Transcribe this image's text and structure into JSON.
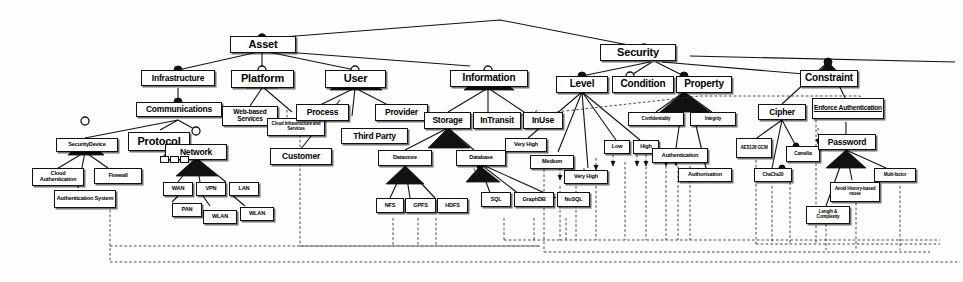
{
  "diagram": {
    "type": "uml-class-hierarchy",
    "colors": {
      "line": "#111111",
      "box_fill": "#ffffff",
      "box_border": "#111111",
      "dashed": "#444444"
    },
    "legend": {
      "filled_diamond": "composition",
      "hollow_diamond": "aggregation",
      "filled_triangle": "generalization",
      "dashed_arrow": "dependency"
    }
  },
  "nodes": {
    "asset": "Asset",
    "security": "Security",
    "infrastructure": "Infrastructure",
    "platform": "Platform",
    "user": "User",
    "information": "Information",
    "communications": "Communications",
    "web_based_services": "Web-based Services",
    "cloud_infra_services": "Cloud Infrastructure and Services",
    "process": "Process",
    "provider": "Provider",
    "third_party": "Third Party",
    "customer": "Customer",
    "security_device": "SecurityDevice",
    "protocol": "Protocol",
    "network": "Network",
    "cloud_authentication": "Cloud Authentication",
    "firewall": "Firewall",
    "authentication_system": "Authentication System",
    "wan": "WAN",
    "vpn": "VPN",
    "lan": "LAN",
    "pan": "PAN",
    "wlan_1": "WLAN",
    "wlan_2": "WLAN",
    "storage": "Storage",
    "intransit": "InTransit",
    "inuse": "InUse",
    "datastore": "Datastore",
    "database": "Database",
    "nfs": "NFS",
    "gpfs": "GPFS",
    "hdfs": "HDFS",
    "sql": "SQL",
    "graphdb": "GraphDB",
    "nosql": "NoSQL",
    "level": "Level",
    "condition": "Condition",
    "property": "Property",
    "very_high_1": "Very High",
    "medium": "Medium",
    "very_high_2": "Very High",
    "low": "Low",
    "high": "High",
    "confidentiality": "Confidentiality",
    "integrity": "Integrity",
    "authentication": "Authentication",
    "authorisation": "Authorisation",
    "constraint": "Constraint",
    "cipher": "Cipher",
    "enforce_authentication": "Enforce Authentication",
    "aes128_gcm": "AES128 GCM",
    "chacha20": "ChaCha20",
    "camellia": "Camellia",
    "password": "Password",
    "multi_factor": "Multi-factor",
    "avoid_history_reuse": "Avoid History-based reuse",
    "length_complexity": "Length & Complexity",
    "proto_a": "",
    "proto_b": "",
    "proto_c": ""
  },
  "hierarchy": {
    "roots": [
      "Asset",
      "Security"
    ],
    "asset_children": [
      "Infrastructure",
      "Platform",
      "User",
      "Information"
    ],
    "security_children": [
      "Level",
      "Condition",
      "Property",
      "Constraint"
    ],
    "infrastructure_children": [
      "Communications"
    ],
    "communications_children": [
      "SecurityDevice",
      "Protocol",
      "Network"
    ],
    "securitydevice_children": [
      "Cloud Authentication",
      "Authentication System",
      "Firewall"
    ],
    "network_children": [
      "WAN",
      "VPN",
      "LAN",
      "PAN",
      "WLAN",
      "WLAN"
    ],
    "platform_children": [
      "Web-based Services",
      "Cloud Infrastructure and Services"
    ],
    "user_children": [
      "Process",
      "Third Party",
      "Provider",
      "Customer"
    ],
    "information_children": [
      "Storage",
      "InTransit",
      "InUse"
    ],
    "storage_children": [
      "Datastore",
      "Database"
    ],
    "datastore_children": [
      "NFS",
      "GPFS",
      "HDFS"
    ],
    "database_children": [
      "SQL",
      "GraphDB",
      "NoSQL"
    ],
    "level_children": [
      "Very High",
      "Medium",
      "Very High",
      "Low",
      "High"
    ],
    "property_children": [
      "Confidentiality",
      "Integrity",
      "Authentication",
      "Authorisation"
    ],
    "constraint_children": [
      "Cipher",
      "Enforce Authentication"
    ],
    "cipher_children": [
      "AES128 GCM",
      "ChaCha20",
      "Camellia"
    ],
    "enforce_authentication_children": [
      "Password"
    ],
    "password_children": [
      "Length & Complexity",
      "Avoid History-based reuse",
      "Multi-factor"
    ]
  }
}
